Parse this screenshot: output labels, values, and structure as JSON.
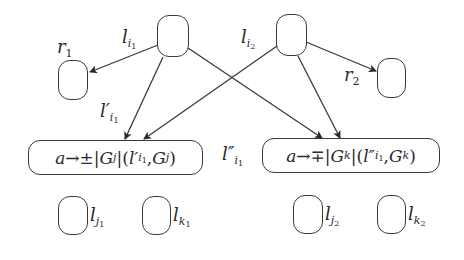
{
  "diagram": {
    "nodes": {
      "l_i1": {
        "label_base": "l",
        "label_sub": "i",
        "label_subsub": "1"
      },
      "l_i2": {
        "label_base": "l",
        "label_sub": "i",
        "label_subsub": "2"
      },
      "r1": {
        "label_base": "r",
        "label_sub": "1"
      },
      "r2": {
        "label_base": "r",
        "label_sub": "2"
      },
      "l_j1": {
        "label_base": "l",
        "label_sub": "j",
        "label_subsub": "1"
      },
      "l_k1": {
        "label_base": "l",
        "label_sub": "k",
        "label_subsub": "1"
      },
      "l_j2": {
        "label_base": "l",
        "label_sub": "j",
        "label_subsub": "2"
      },
      "l_k2": {
        "label_base": "l",
        "label_sub": "k",
        "label_subsub": "2"
      }
    },
    "edge_labels": {
      "l_prime": {
        "base": "l′",
        "sub": "i",
        "subsub": "1"
      },
      "l_dprime": {
        "base": "l″",
        "sub": "i",
        "subsub": "1"
      }
    },
    "rules": {
      "left": {
        "a": "a",
        "arrow": " → ",
        "sign": "±",
        "bar1": "|",
        "G": "G",
        "sub": "j",
        "bar2": "|(",
        "l": "l′",
        "lsub": "i",
        "lsubsub": "1",
        "comma": ", ",
        "G2": "G",
        "sub2": "j",
        "close": ")"
      },
      "right": {
        "a": "a",
        "arrow": " → ",
        "sign": "∓",
        "bar1": "|",
        "G": "G",
        "sub": "k",
        "bar2": "|(",
        "l": "l″",
        "lsub": "i",
        "lsubsub": "1",
        "comma": ", ",
        "G2": "G",
        "sub2": "k",
        "close": ")"
      }
    },
    "colors": {
      "stroke": "#3a3a3a",
      "background": "#ffffff"
    }
  }
}
